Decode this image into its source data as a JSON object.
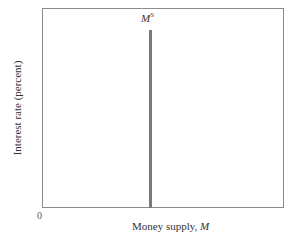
{
  "chart_data": {
    "type": "line",
    "title": "",
    "xlabel": "Money supply, M",
    "ylabel": "Interest rate (percent)",
    "origin_label": "0",
    "grid": false,
    "legend": null,
    "series": [
      {
        "name": "MS",
        "label_main": "M",
        "label_super": "S",
        "description": "Vertical money supply curve (fixed money supply, independent of interest rate)",
        "orientation": "vertical",
        "color": "#7a7a7a",
        "x_fraction_of_axis": 0.44,
        "y_top_fraction_of_axis": 0.89
      }
    ],
    "xlim": [
      0,
      1
    ],
    "ylim": [
      0,
      1
    ]
  },
  "labels": {
    "curve_main": "M",
    "curve_super": "S",
    "origin": "0",
    "x_axis_text": "Money supply, ",
    "x_axis_var": "M",
    "y_axis": "Interest rate (percent)"
  }
}
